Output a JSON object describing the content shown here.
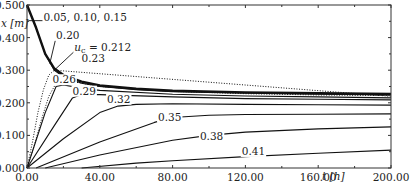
{
  "chart_data": {
    "type": "line",
    "title": "",
    "xlabel": "t [h]",
    "ylabel": "x [m]",
    "xlim": [
      0,
      200
    ],
    "ylim": [
      0,
      0.5
    ],
    "grid": false,
    "legend": "none (inline curve annotations)",
    "x_ticks": [
      "0.00",
      "40.00",
      "80.00",
      "120.00",
      "160.00",
      "200.00"
    ],
    "y_ticks": [
      "0.000",
      "0.100",
      "0.200",
      "0.300",
      "0.400",
      "0.500"
    ],
    "annotations": [
      {
        "text": "0.05, 0.10, 0.15",
        "x": 9,
        "y": 0.45
      },
      {
        "text": "0.20",
        "x": 16,
        "y": 0.395
      },
      {
        "text": "u_c = 0.212",
        "x": 26,
        "y": 0.36
      },
      {
        "text": "0.23",
        "x": 30,
        "y": 0.325
      },
      {
        "text": "0.26",
        "x": 14,
        "y": 0.26
      },
      {
        "text": "0.29",
        "x": 25,
        "y": 0.225
      },
      {
        "text": "0.32",
        "x": 44,
        "y": 0.2
      },
      {
        "text": "0.35",
        "x": 72,
        "y": 0.145
      },
      {
        "text": "0.38",
        "x": 95,
        "y": 0.085
      },
      {
        "text": "0.41",
        "x": 118,
        "y": 0.04
      }
    ],
    "series": [
      {
        "name": "0.05, 0.10, 0.15",
        "style": "solid-thick",
        "x": [
          0,
          5,
          10,
          15,
          20,
          30,
          40,
          60,
          80,
          120,
          160,
          200
        ],
        "y": [
          0.5,
          0.43,
          0.35,
          0.305,
          0.285,
          0.265,
          0.253,
          0.243,
          0.237,
          0.232,
          0.229,
          0.227
        ]
      },
      {
        "name": "0.20",
        "style": "solid",
        "x": [
          0,
          5,
          10,
          15,
          20,
          30,
          40,
          60,
          80,
          120,
          160,
          200
        ],
        "y": [
          0.5,
          0.43,
          0.35,
          0.3,
          0.28,
          0.26,
          0.25,
          0.24,
          0.234,
          0.229,
          0.226,
          0.224
        ]
      },
      {
        "name": "u_c = 0.212",
        "style": "dotted",
        "x": [
          0,
          3,
          6,
          9,
          12,
          15,
          200
        ],
        "y": [
          0.0,
          0.08,
          0.17,
          0.24,
          0.285,
          0.3,
          0.22
        ]
      },
      {
        "name": "0.23",
        "style": "dotted",
        "x": [
          0,
          4,
          8,
          12,
          16,
          20,
          30,
          40,
          80,
          120,
          160,
          200
        ],
        "y": [
          0.0,
          0.07,
          0.15,
          0.22,
          0.26,
          0.27,
          0.26,
          0.25,
          0.235,
          0.228,
          0.224,
          0.222
        ]
      },
      {
        "name": "0.26",
        "style": "solid",
        "x": [
          0,
          10,
          16,
          20,
          30,
          40,
          80,
          120,
          160,
          200
        ],
        "y": [
          0.0,
          0.17,
          0.25,
          0.255,
          0.245,
          0.238,
          0.226,
          0.221,
          0.218,
          0.215
        ]
      },
      {
        "name": "0.29",
        "style": "solid",
        "x": [
          0,
          15,
          25,
          30,
          40,
          80,
          120,
          160,
          200
        ],
        "y": [
          0.0,
          0.13,
          0.215,
          0.225,
          0.225,
          0.218,
          0.213,
          0.211,
          0.209
        ]
      },
      {
        "name": "0.32",
        "style": "solid",
        "x": [
          0,
          20,
          40,
          50,
          60,
          80,
          120,
          160,
          200
        ],
        "y": [
          0.0,
          0.09,
          0.17,
          0.19,
          0.195,
          0.197,
          0.195,
          0.194,
          0.193
        ]
      },
      {
        "name": "0.35",
        "style": "solid",
        "x": [
          5,
          40,
          70,
          80,
          100,
          120,
          160,
          200
        ],
        "y": [
          0.0,
          0.08,
          0.14,
          0.155,
          0.162,
          0.164,
          0.165,
          0.166
        ]
      },
      {
        "name": "0.38",
        "style": "solid",
        "x": [
          10,
          40,
          80,
          100,
          120,
          160,
          200
        ],
        "y": [
          0.0,
          0.04,
          0.085,
          0.1,
          0.11,
          0.12,
          0.126
        ]
      },
      {
        "name": "0.41",
        "style": "solid",
        "x": [
          30,
          60,
          80,
          120,
          160,
          200
        ],
        "y": [
          0.0,
          0.015,
          0.022,
          0.035,
          0.045,
          0.055
        ]
      }
    ]
  },
  "plot_area": {
    "left_px": 27,
    "right_px": 391,
    "top_px": 5,
    "bottom_px": 168
  }
}
